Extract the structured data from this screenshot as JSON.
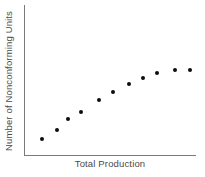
{
  "chart_data": {
    "type": "scatter",
    "title": "",
    "xlabel": "Total Production",
    "ylabel": "Number of Nonconforming Units",
    "xlim": [
      0,
      100
    ],
    "ylim": [
      0,
      100
    ],
    "grid": false,
    "legend": null,
    "tick_labels": {
      "x": [],
      "y": []
    },
    "marker": {
      "shape": "circle",
      "color": "#0d0d0d",
      "size_px": 4
    },
    "axis_color": "#7a7a7a",
    "series": [
      {
        "name": "Nonconforming units",
        "points": [
          {
            "x": 10.0,
            "y": 11.0
          },
          {
            "x": 18.5,
            "y": 17.0
          },
          {
            "x": 25.0,
            "y": 24.0
          },
          {
            "x": 33.0,
            "y": 29.0
          },
          {
            "x": 43.0,
            "y": 36.5
          },
          {
            "x": 51.5,
            "y": 42.0
          },
          {
            "x": 61.0,
            "y": 47.5
          },
          {
            "x": 69.0,
            "y": 51.5
          },
          {
            "x": 77.0,
            "y": 54.5
          },
          {
            "x": 88.0,
            "y": 57.0
          },
          {
            "x": 96.5,
            "y": 57.0
          }
        ]
      }
    ]
  }
}
